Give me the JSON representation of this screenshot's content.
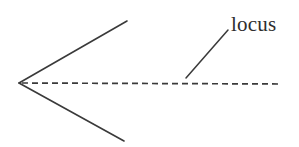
{
  "figure": {
    "kind": "geometry-diagram",
    "background_color": "#ffffff",
    "stroke_color": "#3a3a3a",
    "text_color": "#2e2e2e",
    "canvas": {
      "width": 299,
      "height": 147
    },
    "annotation": {
      "label": "locus",
      "label_x": 231,
      "label_y": 12,
      "font_size": 21
    },
    "elements": {
      "vertex": {
        "x": 19,
        "y": 83
      },
      "upper_arm": {
        "x1": 19,
        "y1": 83,
        "x2": 127,
        "y2": 21
      },
      "lower_arm": {
        "x1": 19,
        "y1": 83,
        "x2": 124,
        "y2": 141
      },
      "axis_dashed": {
        "x1": 22,
        "y1": 83,
        "x2": 281,
        "y2": 84
      },
      "leader_line": {
        "x1": 186,
        "y1": 78,
        "x2": 228,
        "y2": 30
      },
      "dash_pattern": "6 4"
    }
  },
  "chart_data": {
    "type": "scatter",
    "title": "",
    "xlabel": "",
    "ylabel": "",
    "annotations": [
      "locus"
    ],
    "series": [
      {
        "name": "upper-arm",
        "style": "solid",
        "x": [
          19,
          127
        ],
        "y": [
          83,
          21
        ]
      },
      {
        "name": "lower-arm",
        "style": "solid",
        "x": [
          19,
          124
        ],
        "y": [
          83,
          141
        ]
      },
      {
        "name": "axis-of-symmetry",
        "style": "dashed",
        "x": [
          22,
          281
        ],
        "y": [
          83,
          84
        ]
      },
      {
        "name": "locus-leader",
        "style": "solid",
        "x": [
          186,
          228
        ],
        "y": [
          78,
          30
        ]
      }
    ]
  }
}
